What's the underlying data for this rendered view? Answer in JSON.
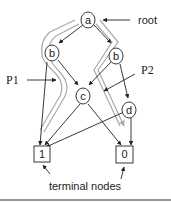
{
  "diagram": {
    "nodes": {
      "a": {
        "label": "a",
        "type": "decision"
      },
      "b_left": {
        "label": "b",
        "type": "decision"
      },
      "b_right": {
        "label": "b",
        "type": "decision"
      },
      "c": {
        "label": "c",
        "type": "decision"
      },
      "d": {
        "label": "d",
        "type": "decision"
      },
      "t1": {
        "label": "1",
        "type": "terminal"
      },
      "t0": {
        "label": "0",
        "type": "terminal"
      }
    },
    "annotations": {
      "root": "root",
      "p1": "P1",
      "p2": "P2",
      "terminal": "terminal nodes"
    },
    "edges": [
      {
        "from": "a",
        "to": "b_left"
      },
      {
        "from": "a",
        "to": "b_right"
      },
      {
        "from": "b_left",
        "to": "c"
      },
      {
        "from": "b_left",
        "to": "t1"
      },
      {
        "from": "b_right",
        "to": "c"
      },
      {
        "from": "b_right",
        "to": "d"
      },
      {
        "from": "c",
        "to": "t1"
      },
      {
        "from": "c",
        "to": "t0"
      },
      {
        "from": "d",
        "to": "t1"
      },
      {
        "from": "d",
        "to": "t0"
      }
    ],
    "paths": [
      {
        "name": "P1",
        "route": [
          "a",
          "b_left",
          "c",
          "t1"
        ],
        "color": "#aaaaaa"
      },
      {
        "name": "P2",
        "route": [
          "a",
          "b_right",
          "c",
          "t0"
        ],
        "color": "#aaaaaa"
      }
    ],
    "colors": {
      "line": "#222222",
      "path": "#aaaaaa"
    }
  }
}
